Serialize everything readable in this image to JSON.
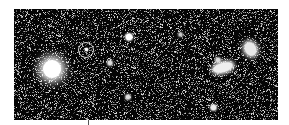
{
  "image": {
    "description": "Deep-field astronomical image with a circled faint object",
    "background": "#050505",
    "noise_density": 0.22,
    "objects": [
      {
        "name": "bright-star",
        "x": 52,
        "y": 69,
        "w": 18,
        "h": 18,
        "blur": 4,
        "color": "#ffffff"
      },
      {
        "name": "galaxy-elongated",
        "x": 223,
        "y": 67,
        "w": 20,
        "h": 9,
        "blur": 2,
        "color": "#eeeeee",
        "rotate": -15
      },
      {
        "name": "galaxy-right",
        "x": 250,
        "y": 49,
        "w": 11,
        "h": 14,
        "blur": 2,
        "color": "#e8e8e8",
        "rotate": -30
      },
      {
        "name": "star-small-1",
        "x": 129,
        "y": 37,
        "w": 6,
        "h": 6,
        "blur": 1,
        "color": "#ffffff"
      },
      {
        "name": "star-small-2",
        "x": 110,
        "y": 63,
        "w": 4,
        "h": 4,
        "blur": 1,
        "color": "#dddddd"
      },
      {
        "name": "star-small-3",
        "x": 128,
        "y": 97,
        "w": 4,
        "h": 4,
        "blur": 1,
        "color": "#dddddd"
      },
      {
        "name": "star-small-4",
        "x": 218,
        "y": 60,
        "w": 4,
        "h": 4,
        "blur": 1,
        "color": "#dddddd"
      },
      {
        "name": "star-small-5",
        "x": 213,
        "y": 107,
        "w": 5,
        "h": 5,
        "blur": 1,
        "color": "#eeeeee"
      },
      {
        "name": "star-small-6",
        "x": 180,
        "y": 34,
        "w": 3,
        "h": 3,
        "blur": 1,
        "color": "#cccccc"
      },
      {
        "name": "circled-object",
        "x": 86,
        "y": 49,
        "w": 3,
        "h": 3,
        "blur": 0.5,
        "color": "#ffffff"
      }
    ],
    "marker": {
      "name": "target-circle",
      "cx": 86,
      "cy": 50,
      "r": 8,
      "color": "#d8d8d8"
    }
  }
}
